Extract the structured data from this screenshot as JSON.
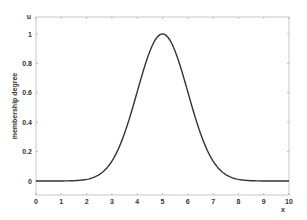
{
  "chart_data": {
    "type": "line",
    "title": "",
    "xlabel": "x",
    "ylabel": "membership degree",
    "corner_label": "u",
    "xlim": [
      0,
      10
    ],
    "ylim": [
      -0.1,
      1.1
    ],
    "grid": false,
    "legend": null,
    "x_ticks": [
      "0",
      "1",
      "2",
      "3",
      "4",
      "5",
      "6",
      "7",
      "8",
      "9",
      "10"
    ],
    "y_ticks": [
      "0",
      "0.2",
      "0.4",
      "0.6",
      "0.8",
      "1"
    ],
    "series": [
      {
        "name": "gaussian membership function",
        "function": "exp(-(x-5)^2/(2*1^2))",
        "center": 5,
        "sigma": 1,
        "color": "#333333",
        "x": [
          0,
          1,
          2,
          2.5,
          3,
          3.5,
          4,
          4.5,
          5,
          5.5,
          6,
          6.5,
          7,
          7.5,
          8,
          9,
          10
        ],
        "values": [
          0.0,
          0.0003,
          0.011,
          0.044,
          0.135,
          0.325,
          0.607,
          0.882,
          1.0,
          0.882,
          0.607,
          0.325,
          0.135,
          0.044,
          0.011,
          0.0003,
          0.0
        ]
      }
    ]
  }
}
